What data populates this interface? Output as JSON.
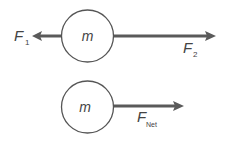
{
  "diagram": {
    "top": {
      "mass_label": "m",
      "force_left": {
        "label": "F",
        "subscript": "1"
      },
      "force_right": {
        "label": "F",
        "subscript": "2"
      }
    },
    "bottom": {
      "mass_label": "m",
      "force_net": {
        "label": "F",
        "subscript": "Net"
      }
    }
  },
  "colors": {
    "stroke": "#555555",
    "arrow": "#5a5a5a",
    "text": "#444444",
    "background": "#ffffff"
  }
}
